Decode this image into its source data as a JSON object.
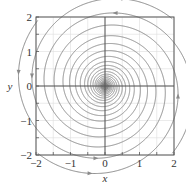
{
  "chart_data": {
    "type": "line",
    "subtype": "phase-portrait",
    "title": "",
    "xlabel": "x",
    "ylabel": "y",
    "xlim": [
      -2,
      2
    ],
    "ylim": [
      -2,
      2
    ],
    "xticks": [
      -2,
      -1,
      0,
      1,
      2
    ],
    "yticks": [
      -2,
      -1,
      0,
      1,
      2
    ],
    "xtick_labels": [
      "−2",
      "−1",
      "0",
      "1",
      "2"
    ],
    "ytick_labels": [
      "−2",
      "−1",
      "0",
      "1",
      "2"
    ],
    "grid": true,
    "grid_step": 0.5,
    "legend": null,
    "equilibrium": {
      "x": 0,
      "y": 0,
      "type": "stable spiral"
    },
    "series": [
      {
        "name": "trajectory from (-2,2)",
        "start": [
          -1.95,
          1.9
        ],
        "description": "descends along left edge then spirals inward"
      },
      {
        "name": "trajectory from (2,2)",
        "start": [
          1.95,
          1.95
        ],
        "description": "runs left along top then spirals inward"
      },
      {
        "name": "trajectory from (2,-2)",
        "start": [
          1.95,
          -1.95
        ],
        "description": "rises along right edge then spirals inward"
      },
      {
        "name": "trajectory from (-2,-2)",
        "start": [
          -1.95,
          -1.95
        ],
        "description": "runs right along bottom then spirals inward"
      }
    ],
    "colors": {
      "trajectory": "#8a8a8a",
      "axis": "#555555",
      "grid": "#dddddd"
    }
  },
  "axes": {
    "x_label": "x",
    "y_label": "y"
  }
}
